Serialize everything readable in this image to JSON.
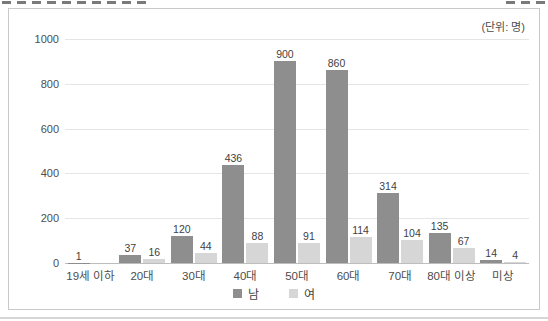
{
  "unit_label": "(단위: 명)",
  "colors": {
    "male_bar": "#8e8e8e",
    "female_bar": "#d6d6d6",
    "gridline": "#e5e5e5",
    "axis_line": "#bdbdbd",
    "frame_border": "#c9c9c9",
    "text": "#4d4d4d"
  },
  "chart_data": {
    "type": "bar",
    "title": "",
    "unit": "(단위: 명)",
    "categories": [
      "19세 이하",
      "20대",
      "30대",
      "40대",
      "50대",
      "60대",
      "70대",
      "80대 이상",
      "미상"
    ],
    "series": [
      {
        "name": "남",
        "color": "#8e8e8e",
        "values": [
          1,
          37,
          120,
          436,
          900,
          860,
          314,
          135,
          14
        ]
      },
      {
        "name": "여",
        "color": "#d6d6d6",
        "values": [
          null,
          16,
          44,
          88,
          91,
          114,
          104,
          67,
          4
        ]
      }
    ],
    "ylim": [
      0,
      1000
    ],
    "yticks": [
      0,
      200,
      400,
      600,
      800,
      1000
    ],
    "xlabel": "",
    "ylabel": "",
    "grid": "horizontal",
    "legend_position": "bottom",
    "value_labels": true
  }
}
